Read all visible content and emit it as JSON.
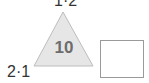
{
  "diagram": {
    "type": "number-triangle",
    "top_label": "1·2",
    "left_label": "2·1",
    "center_value": "10",
    "answer_box": ""
  },
  "colors": {
    "triangle_fill": "#e6e6e6",
    "triangle_stroke": "#bdbdbd",
    "center_text": "#6d6d6d",
    "label_text": "#333333",
    "box_border": "#9a9a9a"
  }
}
